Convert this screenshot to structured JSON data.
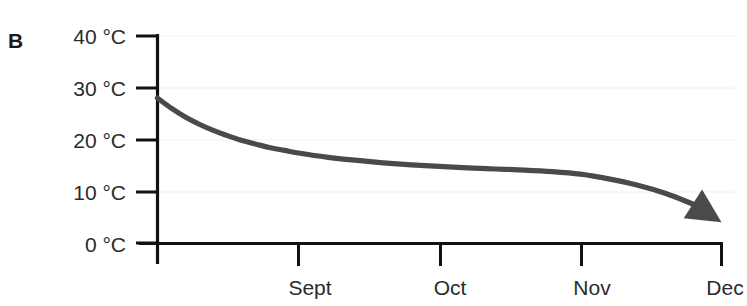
{
  "panel": {
    "label": "B"
  },
  "chart_data": {
    "type": "line",
    "title": "",
    "subtitle": "",
    "xlabel": "",
    "ylabel": "",
    "grid": true,
    "legend": null,
    "legend_position": "none",
    "annotations": [
      {
        "name": "end-arrowhead",
        "kind": "arrowhead",
        "description": "Filled dark-gray triangle at the end of the curve pointing down-right toward Dec",
        "at_x": "Dec",
        "at_y": 4,
        "color": "#4a4a4a"
      }
    ],
    "y_axis": {
      "ticks": [
        0,
        10,
        20,
        30,
        40
      ],
      "tick_labels": [
        "0 °C",
        "10 °C",
        "20 °C",
        "30 °C",
        "40 °C"
      ],
      "ylim": [
        0,
        40
      ],
      "unit": "°C"
    },
    "x_axis": {
      "ticks": [
        0,
        1,
        2,
        3,
        4
      ],
      "tick_labels": [
        "",
        "Sept",
        "Oct",
        "Nov",
        "Dec"
      ],
      "categories": [
        "Sept",
        "Oct",
        "Nov",
        "Dec"
      ],
      "xlim": [
        0,
        4
      ]
    },
    "series": [
      {
        "name": "Temperature",
        "color": "#4a4a4a",
        "x": [
          0.0,
          0.1,
          0.2,
          0.3,
          0.4,
          0.5,
          0.6,
          0.7,
          0.8,
          0.9,
          1.0,
          1.2,
          1.4,
          1.6,
          1.8,
          2.0,
          2.2,
          2.4,
          2.6,
          2.8,
          3.0,
          3.2,
          3.4,
          3.6,
          3.8,
          4.0
        ],
        "values": [
          28.0,
          26.0,
          24.3,
          22.9,
          21.7,
          20.7,
          19.8,
          19.1,
          18.4,
          17.9,
          17.4,
          16.6,
          16.0,
          15.5,
          15.1,
          14.8,
          14.5,
          14.3,
          14.1,
          13.8,
          13.3,
          12.4,
          11.2,
          9.6,
          7.5,
          4.5
        ]
      }
    ]
  }
}
